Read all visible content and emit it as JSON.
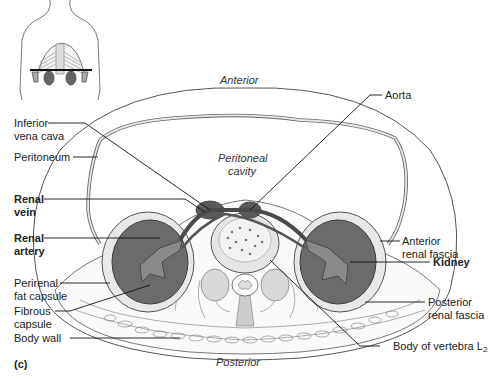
{
  "figure": {
    "panel_label": "(c)",
    "orientation": {
      "anterior": "Anterior",
      "posterior": "Posterior"
    },
    "regions": {
      "peritoneal_cavity_line1": "Peritoneal",
      "peritoneal_cavity_line2": "cavity"
    },
    "labels_left": [
      {
        "line1": "Inferior",
        "line2": "vena cava",
        "bold": false
      },
      {
        "line1": "Peritoneum",
        "line2": "",
        "bold": false
      },
      {
        "line1": "Renal",
        "line2": "vein",
        "bold": true
      },
      {
        "line1": "Renal",
        "line2": "artery",
        "bold": true
      },
      {
        "line1": "Perirenal",
        "line2": "fat capsule",
        "bold": false
      },
      {
        "line1": "Fibrous",
        "line2": "capsule",
        "bold": false
      },
      {
        "line1": "Body wall",
        "line2": "",
        "bold": false
      }
    ],
    "labels_right": [
      {
        "line1": "Aorta",
        "line2": "",
        "bold": false
      },
      {
        "line1": "Anterior",
        "line2": "renal fascia",
        "bold": false
      },
      {
        "line1": "Kidney",
        "line2": "",
        "bold": true
      },
      {
        "line1": "Posterior",
        "line2": "renal fascia",
        "bold": false
      },
      {
        "line1": "Body of vertebra L",
        "subscript": "2",
        "bold": false
      }
    ],
    "inset": {
      "description": "torso-outline-with-section-plane"
    },
    "colors": {
      "kidney": "#6b6b6b",
      "kidney_dark": "#555555",
      "vessel": "#4a4a4a",
      "vertebra": "#d8d8d8",
      "fat": "#e4e4e4",
      "outline": "#333333"
    }
  }
}
